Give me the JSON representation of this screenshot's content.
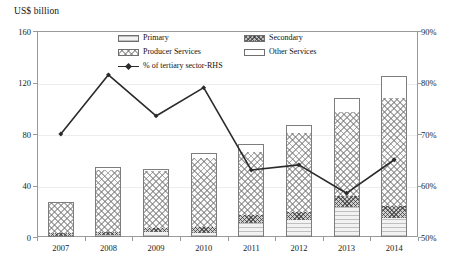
{
  "chart_data": {
    "type": "bar",
    "title": "",
    "ylabel": "US$ billion",
    "xlabel": "",
    "categories": [
      "2007",
      "2008",
      "2009",
      "2010",
      "2011",
      "2012",
      "2013",
      "2014"
    ],
    "ylim": [
      0,
      160
    ],
    "yticks": [
      "0",
      "40",
      "80",
      "120",
      "160"
    ],
    "y2lim": [
      50,
      90
    ],
    "y2ticks": [
      "50%",
      "60%",
      "70%",
      "80%",
      "90%"
    ],
    "y2label": "",
    "grid": true,
    "legend_position": "inside-top-center",
    "stacked": true,
    "series": [
      {
        "name": "Primary",
        "values": [
          1.0,
          1.5,
          4.0,
          3.0,
          11.0,
          13.0,
          23.0,
          15.0
        ]
      },
      {
        "name": "Secondary",
        "values": [
          2.5,
          2.5,
          3.0,
          5.0,
          6.0,
          6.5,
          9.0,
          9.0
        ]
      },
      {
        "name": "Producer Services",
        "values": [
          23.5,
          48.0,
          44.0,
          53.0,
          49.0,
          61.0,
          65.0,
          84.0
        ]
      },
      {
        "name": "Other Services",
        "values": [
          0.0,
          2.0,
          2.0,
          4.0,
          6.0,
          6.5,
          11.0,
          17.0
        ]
      }
    ],
    "bar_totals": [
      27,
      54,
      53,
      65,
      72,
      87,
      108,
      125
    ],
    "line_series": {
      "name": "% of tertiary sector-RHS",
      "axis": "right",
      "values": [
        70.0,
        81.5,
        73.5,
        79.0,
        63.0,
        64.0,
        58.5,
        65.0
      ]
    }
  },
  "legend": {
    "items": [
      {
        "label": "Primary",
        "pattern": "horizontal-lines"
      },
      {
        "label": "Secondary",
        "pattern": "dense-crosshatch"
      },
      {
        "label": "Producer Services",
        "pattern": "checker-crosshatch"
      },
      {
        "label": "Other Services",
        "pattern": "blank"
      },
      {
        "label": "% of tertiary sector-RHS",
        "pattern": "line-marker"
      }
    ]
  },
  "colors": {
    "frame": "#9a9a9a",
    "grid": "#ededed",
    "line": "#2a2a2a",
    "bar_outline": "#7d7d7d"
  }
}
